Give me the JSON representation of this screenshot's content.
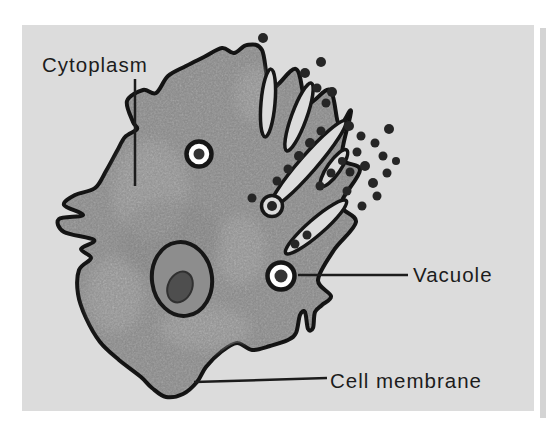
{
  "figure": {
    "type": "biology-cell-diagram",
    "labels": {
      "cytoplasm": "Cytoplasm",
      "vacuole": "Vacuole",
      "cell_membrane": "Cell membrane"
    },
    "colors": {
      "page_background": "#ffffff",
      "panel_background": "#dcdcdc",
      "cytoplasm_fill": "#b4b4b4",
      "nucleus_fill": "#8d8d8d",
      "nucleolus_fill": "#4e4e4e",
      "outline": "#161616",
      "vacuole_fill": "#ffffff",
      "particle_fill": "#262626",
      "label_text": "#1c1c1c"
    }
  }
}
